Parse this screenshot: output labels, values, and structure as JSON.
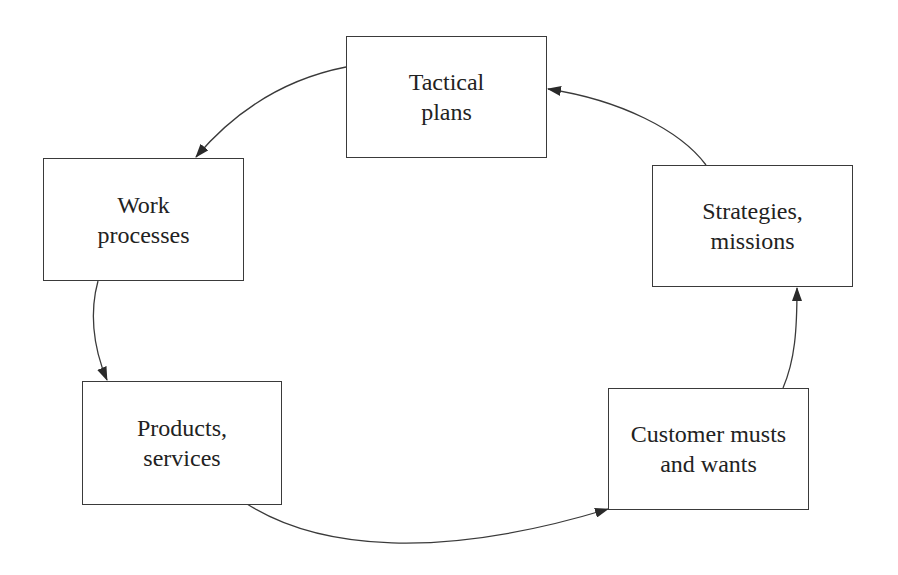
{
  "diagram": {
    "type": "cycle",
    "nodes": [
      {
        "id": "tactical",
        "lines": [
          "Tactical",
          "plans"
        ]
      },
      {
        "id": "work",
        "lines": [
          "Work",
          "processes"
        ]
      },
      {
        "id": "products",
        "lines": [
          "Products,",
          "services"
        ]
      },
      {
        "id": "customer",
        "lines": [
          "Customer musts",
          "and wants"
        ]
      },
      {
        "id": "strategies",
        "lines": [
          "Strategies,",
          "missions"
        ]
      }
    ],
    "edges": [
      {
        "from": "tactical",
        "to": "work"
      },
      {
        "from": "work",
        "to": "products"
      },
      {
        "from": "products",
        "to": "customer"
      },
      {
        "from": "customer",
        "to": "strategies"
      },
      {
        "from": "strategies",
        "to": "tactical"
      }
    ],
    "colors": {
      "line": "#3a3a3a",
      "text": "#222222",
      "background": "#ffffff"
    }
  }
}
